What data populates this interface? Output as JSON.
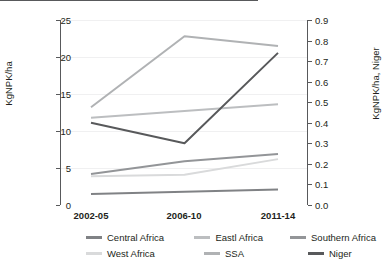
{
  "chart_data": {
    "type": "line",
    "title": "",
    "subtitle": "",
    "xlabel": "",
    "ylabel": "KgNPK/ha",
    "y2label": "KgNPK/ha, Niger",
    "categories": [
      "2002-05",
      "2006-10",
      "2011-14"
    ],
    "ylim": [
      0,
      25
    ],
    "yticks": [
      0,
      5,
      10,
      15,
      20,
      25
    ],
    "ytick_labels": [
      "0",
      "5",
      "10",
      "15",
      "20",
      "25"
    ],
    "y2lim": [
      0.0,
      0.9
    ],
    "y2ticks": [
      0.0,
      0.1,
      0.2,
      0.3,
      0.4,
      0.5,
      0.6,
      0.7,
      0.8,
      0.9
    ],
    "y2tick_labels": [
      "0.0",
      "0.1",
      "0.2",
      "0.3",
      "0.4",
      "0.5",
      "0.6",
      "0.7",
      "0.8",
      "0.9"
    ],
    "grid": "horizontal",
    "legend_position": "bottom",
    "series": [
      {
        "name": "Central Africa",
        "axis": "left",
        "color": "#808285",
        "values": [
          1.5,
          1.8,
          2.1
        ]
      },
      {
        "name": "Eastl Africa",
        "axis": "left",
        "color": "#bcbec0",
        "values": [
          11.8,
          12.7,
          13.6
        ]
      },
      {
        "name": "Southern Africa",
        "axis": "left",
        "color": "#939598",
        "values": [
          4.2,
          5.9,
          6.9
        ]
      },
      {
        "name": "West Africa",
        "axis": "left",
        "color": "#d9dadb",
        "values": [
          3.9,
          4.1,
          6.2
        ]
      },
      {
        "name": "SSA",
        "axis": "left",
        "color": "#b0b2b4",
        "values": [
          13.2,
          22.8,
          21.5
        ]
      },
      {
        "name": "Niger",
        "axis": "right",
        "color": "#58595b",
        "values": [
          0.4,
          0.3,
          0.74
        ]
      }
    ]
  },
  "axes": {
    "left_title": "KgNPK/ha",
    "right_title": "KgNPK/ha, Niger"
  },
  "legend": {
    "rows": [
      [
        {
          "label": "Central Africa",
          "color": "#808285"
        },
        {
          "label": "Eastl Africa",
          "color": "#bcbec0"
        },
        {
          "label": "Southern Africa",
          "color": "#939598"
        }
      ],
      [
        {
          "label": "West Africa",
          "color": "#d9dadb"
        },
        {
          "label": "SSA",
          "color": "#b0b2b4"
        },
        {
          "label": "Niger",
          "color": "#58595b"
        }
      ]
    ]
  }
}
